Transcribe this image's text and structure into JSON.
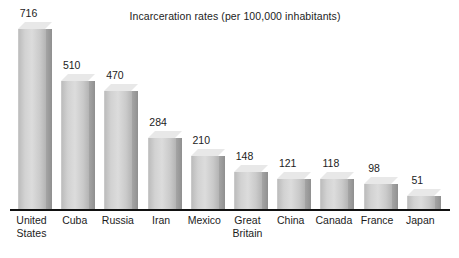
{
  "chart_data": {
    "type": "bar",
    "title": "Incarceration rates (per 100,000 inhabitants)",
    "xlabel": "",
    "ylabel": "",
    "ylim": [
      0,
      716
    ],
    "grid": false,
    "legend": "none",
    "categories": [
      "United States",
      "Cuba",
      "Russia",
      "Iran",
      "Mexico",
      "Great Britain",
      "China",
      "Canada",
      "France",
      "Japan"
    ],
    "category_lines": [
      [
        "United",
        "States"
      ],
      [
        "Cuba"
      ],
      [
        "Russia"
      ],
      [
        "Iran"
      ],
      [
        "Mexico"
      ],
      [
        "Great",
        "Britain"
      ],
      [
        "China"
      ],
      [
        "Canada"
      ],
      [
        "France"
      ],
      [
        "Japan"
      ]
    ],
    "values": [
      716,
      510,
      470,
      284,
      210,
      148,
      121,
      118,
      98,
      51
    ],
    "value_labels": [
      "716",
      "510",
      "470",
      "284",
      "210",
      "148",
      "121",
      "118",
      "98",
      "51"
    ],
    "colors": {
      "bar_face_light": "#dcdcdc",
      "bar_face_dark": "#b4b4b4",
      "bar_side": "#9a9a9a",
      "bar_top": "#e8e8e8",
      "axis": "#111111",
      "text": "#1c1c1c",
      "background": "#ffffff"
    }
  }
}
